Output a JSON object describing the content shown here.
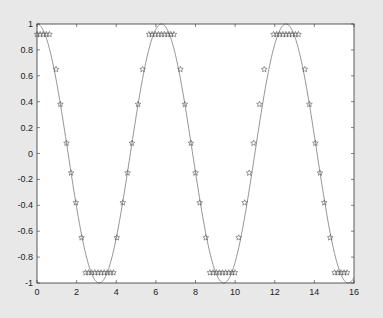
{
  "chart_data": {
    "type": "line",
    "title": "",
    "xlabel": "",
    "ylabel": "",
    "xlim": [
      0,
      16
    ],
    "ylim": [
      -1,
      1
    ],
    "grid": false,
    "xticks": [
      0,
      2,
      4,
      6,
      8,
      10,
      12,
      14,
      16
    ],
    "xtick_labels": [
      "0",
      "2",
      "4",
      "6",
      "8",
      "10",
      "12",
      "14",
      "16"
    ],
    "yticks": [
      -1,
      -0.8,
      -0.6,
      -0.4,
      -0.2,
      0,
      0.2,
      0.4,
      0.6,
      0.8,
      1
    ],
    "ytick_labels": [
      "-1",
      "-0.8",
      "-0.6",
      "-0.4",
      "-0.2",
      "0",
      "0.2",
      "0.4",
      "0.6",
      "0.8",
      "1"
    ],
    "series": [
      {
        "name": "cos(t)",
        "style": "line",
        "color": "#777777",
        "function": "cos",
        "x_range": [
          0,
          16
        ]
      },
      {
        "name": "quantized cos(t)",
        "style": "markers",
        "marker": "star",
        "color": "#555555",
        "x": [
          0,
          0.157,
          0.314,
          0.471,
          0.628,
          0.96,
          1.18,
          1.49,
          1.72,
          1.96,
          2.25,
          2.45,
          2.6,
          2.76,
          2.92,
          3.08,
          3.23,
          3.39,
          3.55,
          3.71,
          3.86,
          4.03,
          4.33,
          4.57,
          4.79,
          5.1,
          5.33,
          5.65,
          5.81,
          5.97,
          6.13,
          6.28,
          6.44,
          6.6,
          6.75,
          6.91,
          7.24,
          7.46,
          7.77,
          8.0,
          8.21,
          8.52,
          8.73,
          8.89,
          9.05,
          9.21,
          9.36,
          9.52,
          9.68,
          9.84,
          9.99,
          10.18,
          10.48,
          10.71,
          10.93,
          11.23,
          11.47,
          11.94,
          12.1,
          12.25,
          12.41,
          12.57,
          12.72,
          12.88,
          13.04,
          13.2,
          13.52,
          13.75,
          14.05,
          14.28,
          14.5,
          14.8,
          15.02,
          15.18,
          15.34,
          15.5,
          15.65
        ],
        "y": [
          0.92,
          0.92,
          0.92,
          0.92,
          0.92,
          0.65,
          0.38,
          0.08,
          -0.15,
          -0.38,
          -0.65,
          -0.92,
          -0.92,
          -0.92,
          -0.92,
          -0.92,
          -0.92,
          -0.92,
          -0.92,
          -0.92,
          -0.92,
          -0.65,
          -0.38,
          -0.15,
          0.08,
          0.38,
          0.65,
          0.92,
          0.92,
          0.92,
          0.92,
          0.92,
          0.92,
          0.92,
          0.92,
          0.92,
          0.65,
          0.38,
          0.08,
          -0.15,
          -0.38,
          -0.65,
          -0.92,
          -0.92,
          -0.92,
          -0.92,
          -0.92,
          -0.92,
          -0.92,
          -0.92,
          -0.92,
          -0.65,
          -0.38,
          -0.15,
          0.08,
          0.38,
          0.65,
          0.92,
          0.92,
          0.92,
          0.92,
          0.92,
          0.92,
          0.92,
          0.92,
          0.92,
          0.65,
          0.38,
          0.08,
          -0.15,
          -0.38,
          -0.65,
          -0.92,
          -0.92,
          -0.92,
          -0.92,
          -0.92
        ]
      }
    ]
  }
}
